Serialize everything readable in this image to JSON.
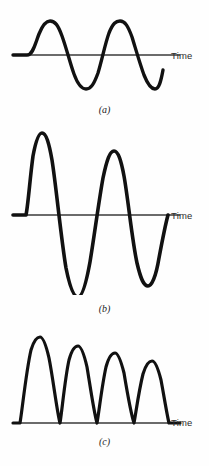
{
  "figure": {
    "background_color": "#fefefe",
    "stroke_color": "#111111",
    "axis_color": "#3a3a3a"
  },
  "panels": [
    {
      "id": "a",
      "caption": "(a)",
      "axis_label": "Time",
      "description": "undamped-sine-wave"
    },
    {
      "id": "b",
      "caption": "(b)",
      "axis_label": "Time",
      "description": "damped-sine-wave"
    },
    {
      "id": "c",
      "caption": "(c)",
      "axis_label": "Time",
      "description": "rectified-decaying-pulses"
    }
  ],
  "chart_data": [
    {
      "type": "line",
      "id": "a",
      "title": "(a)",
      "xlabel": "Time",
      "ylabel": "",
      "grid": false,
      "legend": null,
      "xlim": [
        0,
        2.25
      ],
      "ylim": [
        -1.15,
        1.15
      ],
      "series": [
        {
          "name": "undamped sinusoid",
          "form": "y = sin(2*pi*x)",
          "cycles": 2,
          "amplitude": 1.0,
          "decay": 0.0,
          "peaks": [
            1.0,
            1.0
          ],
          "troughs": [
            -1.0,
            -1.0
          ]
        }
      ],
      "path": "M 13,55 L 27,55 C 33,55 35,44 39,34 C 43,24 46,21 50,21 C 55,21 58,25 62,36 C 67,50 70,63 74,74 C 78,85 82,89 86,89 C 91,89 94,84 98,73 C 102,60 105,44 109,33 C 113,23 116,21 120,21 C 125,21 128,26 132,37 C 136,50 140,64 144,75 C 148,85 151,89 155,89 C 159,89 161,81 163,70"
    },
    {
      "type": "line",
      "id": "b",
      "title": "(b)",
      "xlabel": "Time",
      "ylabel": "",
      "grid": false,
      "legend": null,
      "xlim": [
        0,
        2.25
      ],
      "ylim": [
        -1.25,
        1.25
      ],
      "series": [
        {
          "name": "damped sinusoid",
          "form": "y = exp(-k*x) * sin(2*pi*x)",
          "cycles": 2,
          "amplitude": 1.0,
          "decay": 0.32,
          "peaks": [
            1.0,
            0.78
          ],
          "troughs": [
            -1.0,
            -0.62
          ]
        }
      ],
      "path": "M 13,215 L 26,215 C 28,206 30,178 33,156 C 36,140 39,133 42,133 C 46,133 49,143 52,160 C 56,185 61,238 66,268 C 70,288 74,297 78,297 C 82,297 86,284 90,262 C 94,238 99,200 103,178 C 107,159 110,151 114,151 C 118,151 121,160 124,176 C 128,198 132,240 137,263 C 141,280 144,286 148,286 C 152,286 156,276 159,258 C 162,242 165,226 168,215"
    },
    {
      "type": "line",
      "id": "c",
      "title": "(c)",
      "xlabel": "Time",
      "ylabel": "",
      "grid": false,
      "legend": null,
      "xlim": [
        0,
        2.25
      ],
      "ylim": [
        0,
        1.15
      ],
      "series": [
        {
          "name": "full-wave rectified decaying pulses",
          "form": "y = exp(-k*x) * |sin(2*pi*x)|",
          "pulses": 4,
          "amplitude": 1.0,
          "decay": 0.18,
          "peaks": [
            1.0,
            0.85,
            0.74,
            0.62
          ]
        }
      ],
      "path": "M 13,423 L 20,423 C 22,412 26,372 31,350 C 34,340 37,337 40,337 C 43,337 46,345 49,358 C 53,378 57,412 60,423 C 62,411 65,378 69,360 C 72,349 75,346 78,346 C 81,346 84,354 87,367 C 90,385 94,413 97,423 C 99,412 102,385 106,367 C 109,356 112,353 115,353 C 118,353 121,361 124,373 C 127,391 131,414 134,423 C 136,412 139,390 143,374 C 146,364 149,361 152,361 C 155,361 158,368 161,380 C 164,396 167,415 169,423 L 180,423"
    }
  ]
}
